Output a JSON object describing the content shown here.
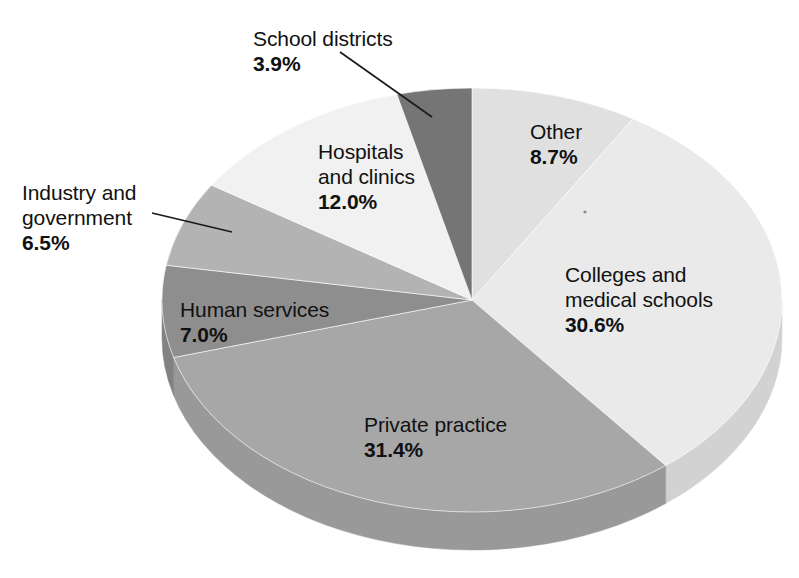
{
  "chart_data": {
    "type": "pie",
    "title": "",
    "subtitle": "",
    "xlabel": "",
    "ylabel": "",
    "legend_position": "none",
    "grid": false,
    "style": "3d-pie",
    "start_angle_deg": 0,
    "direction": "clockwise",
    "units": "percent",
    "total": 100.1,
    "categories": [
      "Other",
      "Colleges and medical schools",
      "Private practice",
      "Human services",
      "Industry and government",
      "Hospitals and clinics",
      "School districts"
    ],
    "values": [
      8.7,
      30.6,
      31.4,
      7.0,
      6.5,
      12.0,
      3.9
    ],
    "labels": [
      "8.7%",
      "30.6%",
      "31.4%",
      "7.0%",
      "6.5%",
      "12.0%",
      "3.9%"
    ],
    "slices": [
      {
        "name": "Other",
        "name_lines": [
          "Other"
        ],
        "value": 8.7,
        "label": "8.7%",
        "color": "#e0e0e0",
        "side_color": "#c9c9c9",
        "leader": false
      },
      {
        "name": "Colleges and medical schools",
        "name_lines": [
          "Colleges and",
          "medical schools"
        ],
        "value": 30.6,
        "label": "30.6%",
        "color": "#eaeaea",
        "side_color": "#d2d2d2",
        "leader": false
      },
      {
        "name": "Private practice",
        "name_lines": [
          "Private practice"
        ],
        "value": 31.4,
        "label": "31.4%",
        "color": "#a7a7a7",
        "side_color": "#999999",
        "leader": false
      },
      {
        "name": "Human services",
        "name_lines": [
          "Human services"
        ],
        "value": 7.0,
        "label": "7.0%",
        "color": "#8e8e8e",
        "side_color": "#828282",
        "leader": false
      },
      {
        "name": "Industry and government",
        "name_lines": [
          "Industry and",
          "government"
        ],
        "value": 6.5,
        "label": "6.5%",
        "color": "#b3b3b3",
        "side_color": "#a3a3a3",
        "leader": true
      },
      {
        "name": "Hospitals and clinics",
        "name_lines": [
          "Hospitals",
          "and clinics"
        ],
        "value": 12.0,
        "label": "12.0%",
        "color": "#f1f1f1",
        "side_color": "#d8d8d8",
        "leader": false
      },
      {
        "name": "School districts",
        "name_lines": [
          "School districts"
        ],
        "value": 3.9,
        "label": "3.9%",
        "color": "#757575",
        "side_color": "#6b6b6b",
        "leader": true
      }
    ]
  },
  "labels": {
    "school_districts": {
      "name": "School districts",
      "pct": "3.9%"
    },
    "other": {
      "name": "Other",
      "pct": "8.7%"
    },
    "colleges": {
      "name_line1": "Colleges and",
      "name_line2": "medical schools",
      "pct": "30.6%"
    },
    "private_practice": {
      "name": "Private practice",
      "pct": "31.4%"
    },
    "human_services": {
      "name": "Human services",
      "pct": "7.0%"
    },
    "industry": {
      "name_line1": "Industry and",
      "name_line2": "government",
      "pct": "6.5%"
    },
    "hospitals": {
      "name_line1": "Hospitals",
      "name_line2": "and clinics",
      "pct": "12.0%"
    }
  },
  "geometry": {
    "cx": 472,
    "cy": 300,
    "rx": 310,
    "ry": 212,
    "depth": 38
  },
  "colors": {
    "background": "#ffffff",
    "text": "#111111",
    "leader_line": "#1a1a1a"
  }
}
